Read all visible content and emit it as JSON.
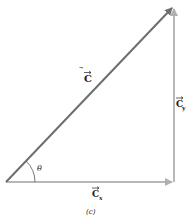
{
  "diagram": {
    "caption": "(c)",
    "angle_label": "θ",
    "vectors": {
      "resultant": {
        "name": "C",
        "label": "C"
      },
      "x_component": {
        "name": "C_x",
        "label": "C",
        "subscript": "x"
      },
      "y_component": {
        "name": "C_y",
        "label": "C",
        "subscript": "y"
      }
    },
    "colors": {
      "resultant": "#6e6e6e",
      "components": "#b8b8b8",
      "text": "#222222"
    }
  }
}
